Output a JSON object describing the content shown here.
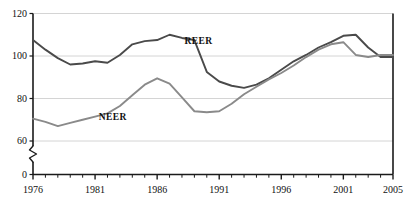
{
  "chart_data": {
    "type": "line",
    "title": "",
    "subtitle": "",
    "xlabel": "",
    "ylabel": "",
    "xlim": [
      1976,
      2005
    ],
    "ylim": [
      0,
      120
    ],
    "y_axis_break": {
      "present": true,
      "between": [
        0,
        60
      ]
    },
    "yticks": [
      0,
      60,
      80,
      100,
      120
    ],
    "ytick_labels": [
      "0",
      "60",
      "80",
      "100",
      "120"
    ],
    "gridlines": {
      "horizontal": true,
      "values": [
        60,
        80,
        100,
        120
      ],
      "vertical": false
    },
    "xticks": [
      1976,
      1977,
      1978,
      1979,
      1980,
      1981,
      1982,
      1983,
      1984,
      1985,
      1986,
      1987,
      1988,
      1989,
      1990,
      1991,
      1992,
      1993,
      1994,
      1995,
      1996,
      1997,
      1998,
      1999,
      2000,
      2001,
      2002,
      2003,
      2004,
      2005
    ],
    "xtick_labels": [
      "1976",
      "1981",
      "1986",
      "1991",
      "1996",
      "2001",
      "2005"
    ],
    "xtick_labeled_values": [
      1976,
      1981,
      1986,
      1991,
      1996,
      2001,
      2005
    ],
    "legend": {
      "position": "inline-annotation",
      "entries": [
        "REER",
        "NEER"
      ]
    },
    "x": [
      1976,
      1977,
      1978,
      1979,
      1980,
      1981,
      1982,
      1983,
      1984,
      1985,
      1986,
      1987,
      1988,
      1989,
      1990,
      1991,
      1992,
      1993,
      1994,
      1995,
      1996,
      1997,
      1998,
      1999,
      2000,
      2001,
      2002,
      2003,
      2004,
      2005
    ],
    "series": [
      {
        "name": "REER",
        "color": "#4a4a4a",
        "label_x": 1988.2,
        "label_y": 107.0,
        "values": [
          107.5,
          103.0,
          99.0,
          96.0,
          96.5,
          97.5,
          96.8,
          100.5,
          105.5,
          107.0,
          107.5,
          110.0,
          108.5,
          107.5,
          92.5,
          88.0,
          86.0,
          85.0,
          86.5,
          89.5,
          93.5,
          97.5,
          100.5,
          104.0,
          106.5,
          109.5,
          110.0,
          104.0,
          99.5,
          99.5
        ]
      },
      {
        "name": "NEER",
        "color": "#8a8a8a",
        "label_x": 1981.3,
        "label_y": 71.5,
        "values": [
          70.5,
          69.0,
          67.0,
          68.5,
          70.0,
          71.5,
          73.0,
          76.5,
          81.5,
          86.5,
          89.5,
          87.0,
          80.5,
          74.0,
          73.5,
          74.0,
          77.5,
          82.0,
          85.5,
          89.0,
          92.0,
          95.5,
          99.5,
          103.0,
          105.5,
          106.5,
          100.5,
          99.5,
          100.5,
          100.5
        ]
      }
    ],
    "series_tail": {
      "note_x": [
        2002,
        2003,
        2004,
        2005
      ],
      "REER_tail": [
        110.0,
        104.0,
        94.0,
        93.0
      ],
      "NEER_tail": [
        106.5,
        101.0,
        97.5,
        97.5
      ]
    }
  },
  "axis": {
    "ytick_labels": [
      "120",
      "100",
      "80",
      "60",
      "0"
    ],
    "xtick_labels": [
      "1976",
      "1981",
      "1986",
      "1991",
      "1996",
      "2001",
      "2005"
    ]
  },
  "annotations": {
    "reer_label": "REER",
    "neer_label": "NEER"
  },
  "colors": {
    "reer": "#4a4a4a",
    "neer": "#8a8a8a",
    "axis": "#1a1a1a",
    "grid": "#c9c9c9",
    "background": "#ffffff"
  }
}
